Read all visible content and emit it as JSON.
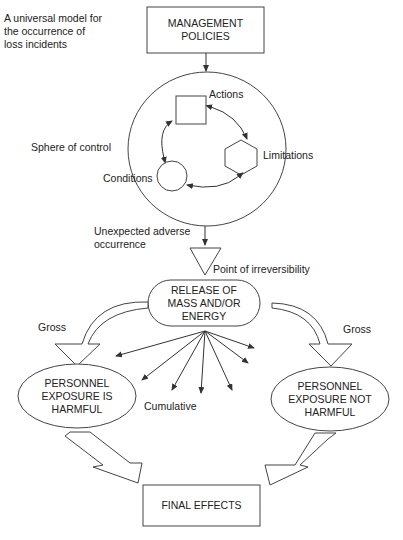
{
  "title": {
    "line1": "A universal model for",
    "line2": "the occurrence of",
    "line3": "loss incidents"
  },
  "nodes": {
    "management": {
      "line1": "MANAGEMENT",
      "line2": "POLICIES"
    },
    "sphere_label": "Sphere of control",
    "actions": "Actions",
    "limitations": "Limitations",
    "conditions": "Conditions",
    "unexpected": {
      "line1": "Unexpected adverse",
      "line2": "occurrence"
    },
    "irreversibility": "Point of irreversibility",
    "release": {
      "line1": "RELEASE OF",
      "line2": "MASS AND/OR",
      "line3": "ENERGY"
    },
    "gross_left": "Gross",
    "gross_right": "Gross",
    "cumulative": "Cumulative",
    "harmful": {
      "line1": "PERSONNEL",
      "line2": "EXPOSURE IS",
      "line3": "HARMFUL"
    },
    "not_harmful": {
      "line1": "PERSONNEL",
      "line2": "EXPOSURE NOT",
      "line3": "HARMFUL"
    },
    "final": "FINAL EFFECTS"
  },
  "colors": {
    "stroke": "#333333",
    "background": "#ffffff",
    "text": "#222222"
  }
}
